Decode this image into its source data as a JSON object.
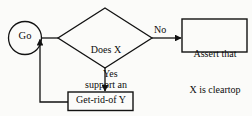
{
  "diagram": {
    "type": "flowchart",
    "stroke_color": "#121212",
    "background_color": "#fbfbf9",
    "nodes": [
      {
        "id": "start",
        "shape": "circle",
        "label": "Go"
      },
      {
        "id": "decision",
        "shape": "diamond",
        "label": "Does X\nsupport an\nobject Y?",
        "line1": "Does X",
        "line2": "support an",
        "line3": "object Y?"
      },
      {
        "id": "assert",
        "shape": "rectangle",
        "label": "Assert that\nX is cleartop",
        "line1": "Assert that",
        "line2": "X is cleartop"
      },
      {
        "id": "getrid",
        "shape": "rectangle",
        "label": "Get-rid-of Y"
      }
    ],
    "edges": [
      {
        "id": "start-to-decision",
        "from": "start",
        "to": "decision",
        "label": ""
      },
      {
        "id": "decision-to-assert",
        "from": "decision",
        "to": "assert",
        "label": "No"
      },
      {
        "id": "decision-to-getrid",
        "from": "decision",
        "to": "getrid",
        "label": "Yes"
      },
      {
        "id": "getrid-to-decision",
        "from": "getrid",
        "to": "decision",
        "label": ""
      }
    ]
  }
}
